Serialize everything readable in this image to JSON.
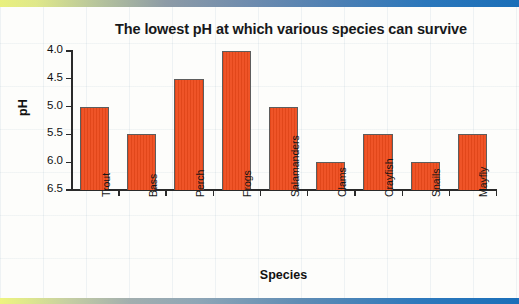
{
  "slide": {
    "top_accent_colors": [
      "#e9f07e",
      "#1b6fb8"
    ],
    "bottom_accent_colors": [
      "#eef47f",
      "#1a6fb9"
    ],
    "background_color": "#fdfdfb"
  },
  "chart_data": {
    "type": "bar",
    "title": "The lowest pH at which various species can survive",
    "xlabel": "Species",
    "ylabel": "pH",
    "categories": [
      "Trout",
      "Bass",
      "Perch",
      "Frogs",
      "Salamanders",
      "Clams",
      "Crayfish",
      "Snails",
      "Mayfly"
    ],
    "values": [
      5.0,
      5.5,
      4.5,
      4.0,
      5.0,
      6.0,
      5.5,
      6.0,
      5.5
    ],
    "ylim": [
      4.0,
      6.5
    ],
    "y_axis_inverted": true,
    "yticks": [
      "4.0",
      "4.5",
      "5.0",
      "5.5",
      "6.0",
      "6.5"
    ],
    "ytick_values": [
      4.0,
      4.5,
      5.0,
      5.5,
      6.0,
      6.5
    ],
    "grid": false,
    "legend": false,
    "bar_color": "#ee4b1c",
    "bar_border_color": "#5d5d5d"
  }
}
